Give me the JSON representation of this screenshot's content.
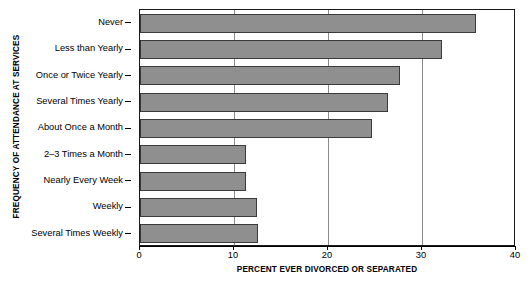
{
  "chart_data": {
    "type": "bar",
    "orientation": "horizontal",
    "title": "",
    "xlabel": "PERCENT EVER DIVORCED OR SEPARATED",
    "ylabel": "FREQUENCY OF ATTENDANCE AT SERVICES",
    "xlim": [
      0,
      40
    ],
    "xticks": [
      0,
      10,
      20,
      30,
      40
    ],
    "xtick_labels": [
      "0",
      "10",
      "20",
      "30",
      "40"
    ],
    "grid": "vertical-gridlines-at-xticks",
    "legend": "none",
    "bar_color": "#8f8f8f",
    "bar_edge_color": "#3a3a3a",
    "categories": [
      "Never",
      "Less than Yearly",
      "Once or Twice Yearly",
      "Several Times Yearly",
      "About Once a Month",
      "2–3 Times a Month",
      "Nearly Every Week",
      "Weekly",
      "Several Times Weekly"
    ],
    "values": [
      35.7,
      32.1,
      27.7,
      26.4,
      24.7,
      11.3,
      11.3,
      12.4,
      12.6
    ]
  }
}
